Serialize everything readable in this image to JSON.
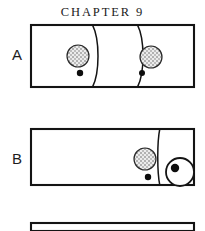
{
  "figure": {
    "title": "CHAPTER 9",
    "accent_color": "#141414",
    "background_color": "#ffffff",
    "stipple_fill_color": "#d8d8d8",
    "dot_color": "#0d0d0d"
  },
  "panels": [
    {
      "label": "A",
      "label_x": 12,
      "label_y": 47,
      "box": {
        "x": 31,
        "y": 25,
        "width": 163,
        "height": 62
      },
      "furrows": [
        {
          "name": "furrow-left",
          "top_x": 92,
          "mid_x": 100,
          "bottom_x": 92
        },
        {
          "name": "furrow-right",
          "top_x": 137,
          "mid_x": 145,
          "bottom_x": 137
        }
      ],
      "nuclei": [
        {
          "name": "nucleus-left",
          "cx": 78,
          "cy": 56,
          "r": 11
        },
        {
          "name": "nucleus-right",
          "cx": 151,
          "cy": 57,
          "r": 11
        }
      ],
      "dots": [
        {
          "name": "body-dot-left",
          "cx": 80,
          "cy": 73,
          "r": 3.2
        },
        {
          "name": "body-dot-right",
          "cx": 142,
          "cy": 73,
          "r": 3.0
        }
      ],
      "polar_bodies": []
    },
    {
      "label": "B",
      "label_x": 12,
      "label_y": 151,
      "box": {
        "x": 31,
        "y": 129,
        "width": 163,
        "height": 56
      },
      "furrows": [
        {
          "name": "furrow-right",
          "top_x": 160,
          "mid_x": 157,
          "bottom_x": 160
        }
      ],
      "nuclei": [
        {
          "name": "nucleus-main",
          "cx": 145,
          "cy": 159,
          "r": 11
        }
      ],
      "dots": [
        {
          "name": "body-dot-main",
          "cx": 148,
          "cy": 177,
          "r": 3.2
        }
      ],
      "polar_bodies": [
        {
          "name": "polar-body",
          "cx": 180,
          "cy": 172,
          "r": 14,
          "dot_cx": 175,
          "dot_cy": 168,
          "dot_r": 4.2
        }
      ]
    },
    {
      "label": "",
      "box": {
        "x": 31,
        "y": 223,
        "width": 163,
        "height": 8
      },
      "furrows": [],
      "nuclei": [],
      "dots": [],
      "polar_bodies": []
    }
  ]
}
